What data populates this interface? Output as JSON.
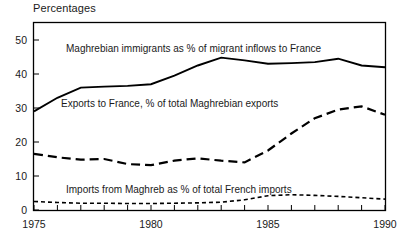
{
  "chart": {
    "title": "Percentages",
    "axis": {
      "y_ticks": [
        "0",
        "10",
        "20",
        "30",
        "40",
        "50"
      ],
      "x_ticks": [
        "1975",
        "1980",
        "1985",
        "1990"
      ]
    }
  },
  "annotations": {
    "top": "Maghrebian immigrants as % of migrant inflows to France",
    "middle": "Exports to France, % of total Maghrebian exports",
    "bottom": "Imports from Maghreb as % of total French imports"
  },
  "chart_data": {
    "type": "line",
    "title": "Percentages",
    "xlabel": "",
    "ylabel": "Percentages",
    "xlim": [
      1975,
      1990
    ],
    "ylim": [
      0,
      55
    ],
    "y_tick_values": [
      0,
      10,
      20,
      30,
      40,
      50
    ],
    "x_tick_values": [
      1975,
      1980,
      1985,
      1990
    ],
    "x_minor_tick_interval": 1,
    "grid": false,
    "legend": "inline-annotations",
    "x": [
      1975,
      1976,
      1977,
      1978,
      1979,
      1980,
      1981,
      1982,
      1983,
      1984,
      1985,
      1986,
      1987,
      1988,
      1989,
      1990
    ],
    "series": [
      {
        "name": "Maghrebian immigrants as % of migrant inflows to France",
        "style": "solid",
        "values": [
          29.0,
          33.0,
          36.0,
          36.3,
          36.5,
          37.0,
          39.5,
          42.5,
          44.8,
          44.0,
          43.0,
          43.2,
          43.5,
          44.5,
          42.5,
          42.0
        ]
      },
      {
        "name": "Exports to France, % of total Maghrebian exports",
        "style": "long-dash",
        "values": [
          16.5,
          15.5,
          14.8,
          15.0,
          13.5,
          13.2,
          14.5,
          15.2,
          14.5,
          14.0,
          17.5,
          22.5,
          27.0,
          29.5,
          30.5,
          28.0
        ]
      },
      {
        "name": "Imports from Maghreb as % of total French imports",
        "style": "dotted",
        "values": [
          2.5,
          2.2,
          2.0,
          2.0,
          1.9,
          1.9,
          2.0,
          2.1,
          2.3,
          3.0,
          4.2,
          4.5,
          4.3,
          4.0,
          3.6,
          3.2
        ]
      }
    ],
    "series_extended_notes": {
      "exports_tail": [
        26.0,
        24.0,
        24.0,
        22.0,
        22.0,
        21.5,
        23.0,
        25.0
      ],
      "imports_tail": [
        2.6,
        2.2,
        2.0,
        1.8,
        1.6,
        1.5,
        1.5,
        1.5
      ]
    }
  }
}
